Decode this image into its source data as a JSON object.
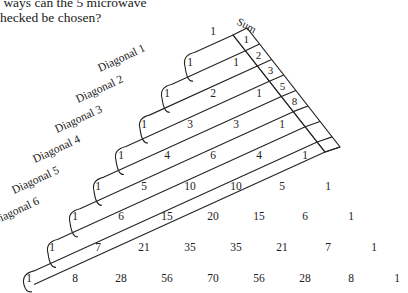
{
  "question": {
    "line1": " ways can the 5 microwave",
    "line2": "hecked be chosen?"
  },
  "sum_label": "Sum",
  "diagonal_labels": [
    "Diagonal 1",
    "Diagonal 2",
    "Diagonal 3",
    "Diagonal 4",
    "Diagonal 5",
    "Diagonal 6"
  ],
  "sums": [
    "1",
    "2",
    "3",
    "5",
    "8",
    "",
    "",
    ""
  ],
  "triangle_rows": [
    [
      "1"
    ],
    [
      "1",
      "1"
    ],
    [
      "1",
      "2",
      "1"
    ],
    [
      "1",
      "3",
      "3",
      "1"
    ],
    [
      "1",
      "4",
      "6",
      "4",
      "1"
    ],
    [
      "1",
      "5",
      "10",
      "10",
      "5",
      "1"
    ],
    [
      "1",
      "6",
      "15",
      "20",
      "15",
      "6",
      "1"
    ],
    [
      "1",
      "7",
      "21",
      "35",
      "35",
      "21",
      "7",
      "1"
    ],
    [
      "1",
      "8",
      "28",
      "56",
      "70",
      "56",
      "28",
      "8",
      "1"
    ]
  ],
  "colors": {
    "ink": "#222222",
    "background": "#ffffff"
  }
}
